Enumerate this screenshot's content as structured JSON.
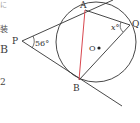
{
  "diagram": {
    "type": "geometry",
    "points": {
      "P": {
        "label": "P",
        "x": 22,
        "y": 41
      },
      "A": {
        "label": "A",
        "x": 85,
        "y": 10
      },
      "B": {
        "label": "B",
        "x": 79,
        "y": 80
      },
      "Q": {
        "label": "Q",
        "x": 130,
        "y": 25
      },
      "O": {
        "label": "O",
        "x": 98,
        "y": 48
      }
    },
    "circle": {
      "cx": 96,
      "cy": 42,
      "r": 40
    },
    "angle_labels": {
      "at_P": "56°",
      "at_Q": "x°"
    },
    "chord_AB_color": "#d9474f",
    "line_color": "#333333"
  },
  "margin_text": {
    "t1": "に",
    "t2": "装",
    "t3": "B",
    "t4": "2"
  }
}
